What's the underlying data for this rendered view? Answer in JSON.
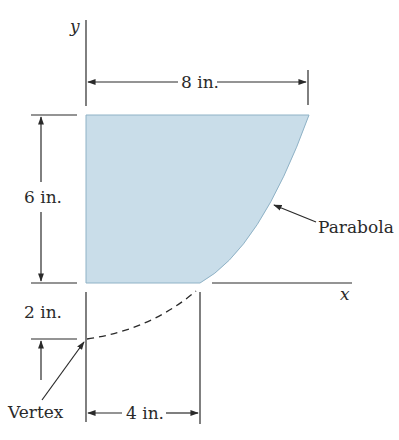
{
  "diagram": {
    "axes": {
      "x_label": "x",
      "y_label": "y"
    },
    "region": {
      "fill_color": "#c9dde9",
      "edge_color": "#8fb2c6"
    },
    "curve_label": "Parabola",
    "vertex_label": "Vertex",
    "dimensions": {
      "top_width": "8 in.",
      "height": "6 in.",
      "vertex_offset": "2 in.",
      "bottom_width": "4 in."
    }
  }
}
